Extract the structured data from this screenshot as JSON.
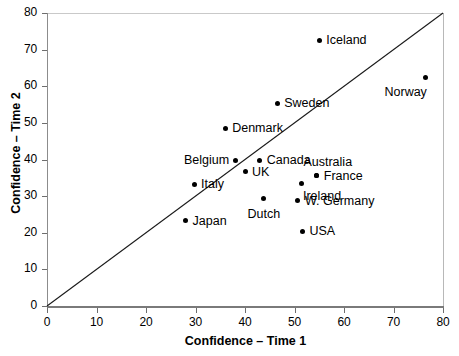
{
  "chart_data": {
    "type": "scatter",
    "title": "",
    "xlabel": "Confidence – Time 1",
    "ylabel": "Confidence – Time 2",
    "xlim": [
      0,
      80
    ],
    "ylim": [
      0,
      80
    ],
    "xticks": [
      0,
      10,
      20,
      30,
      40,
      50,
      60,
      70,
      80
    ],
    "yticks": [
      0,
      10,
      20,
      30,
      40,
      50,
      60,
      70,
      80
    ],
    "grid": false,
    "legend": null,
    "annotations": [
      {
        "text": "identity line y = x",
        "type": "reference-line",
        "from": [
          0,
          0
        ],
        "to": [
          80,
          80
        ]
      }
    ],
    "points": [
      {
        "label": "Iceland",
        "x": 55.0,
        "y": 72.5,
        "label_pos": "right"
      },
      {
        "label": "Norway",
        "x": 76.5,
        "y": 62.5,
        "label_pos": "below-left"
      },
      {
        "label": "Sweden",
        "x": 46.5,
        "y": 55.3,
        "label_pos": "right"
      },
      {
        "label": "Denmark",
        "x": 36.0,
        "y": 48.5,
        "label_pos": "right"
      },
      {
        "label": "Belgium",
        "x": 38.0,
        "y": 39.8,
        "label_pos": "left"
      },
      {
        "label": "Canada",
        "x": 43.0,
        "y": 39.8,
        "label_pos": "right"
      },
      {
        "label": "Australia",
        "x": 54.5,
        "y": 35.5,
        "label_pos": "above"
      },
      {
        "label": "France",
        "x": 54.5,
        "y": 35.5,
        "label_pos": "right"
      },
      {
        "label": "UK",
        "x": 40.0,
        "y": 36.6,
        "label_pos": "right"
      },
      {
        "label": "Italy",
        "x": 29.7,
        "y": 33.3,
        "label_pos": "right"
      },
      {
        "label": "Ireland",
        "x": 51.5,
        "y": 33.4,
        "label_pos": "below-right"
      },
      {
        "label": "W. Germany",
        "x": 50.7,
        "y": 28.7,
        "label_pos": "right"
      },
      {
        "label": "Dutch",
        "x": 43.8,
        "y": 29.4,
        "label_pos": "below"
      },
      {
        "label": "Japan",
        "x": 28.0,
        "y": 23.3,
        "label_pos": "right"
      },
      {
        "label": "USA",
        "x": 51.6,
        "y": 20.4,
        "label_pos": "right"
      }
    ]
  },
  "axes": {
    "x_tick_labels": [
      "0",
      "10",
      "20",
      "30",
      "40",
      "50",
      "60",
      "70",
      "80"
    ],
    "y_tick_labels": [
      "0",
      "10",
      "20",
      "30",
      "40",
      "50",
      "60",
      "70",
      "80"
    ],
    "x_title": "Confidence – Time 1",
    "y_title": "Confidence – Time 2"
  },
  "colors": {
    "point": "#000000",
    "line": "#1a1a1a",
    "axis": "#7a7a7a",
    "background": "#ffffff",
    "text": "#000000"
  }
}
